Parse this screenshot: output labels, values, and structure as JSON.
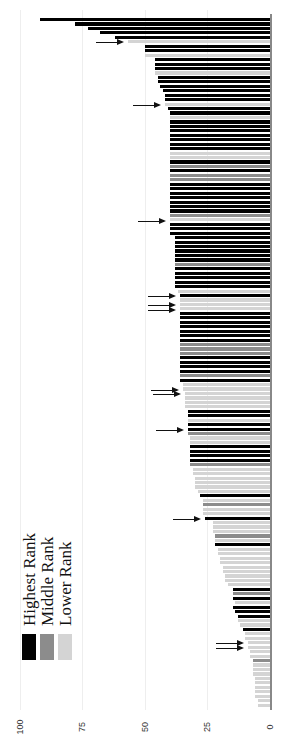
{
  "chart_data": {
    "type": "bar",
    "orientation": "horizontal-rotated",
    "title": "",
    "xlabel": "",
    "ylabel": "",
    "ylim": [
      0,
      100
    ],
    "ticks": [
      "0",
      "25",
      "50",
      "75",
      "100"
    ],
    "grid": true,
    "legend": {
      "position": "lower-left",
      "entries": [
        {
          "label": "Highest Rank",
          "color": "#000000"
        },
        {
          "label": "Middle Rank",
          "color": "#8c8c8c"
        },
        {
          "label": "Lower Rank",
          "color": "#d4d4d4"
        }
      ]
    },
    "bars": [
      {
        "v": 92,
        "c": "H"
      },
      {
        "v": 78,
        "c": "H"
      },
      {
        "v": 73,
        "c": "H"
      },
      {
        "v": 68,
        "c": "H"
      },
      {
        "v": 62,
        "c": "H"
      },
      {
        "v": 57,
        "c": "L"
      },
      {
        "v": 50,
        "c": "H"
      },
      {
        "v": 50,
        "c": "H"
      },
      {
        "v": 50,
        "c": "L"
      },
      {
        "v": 46,
        "c": "H"
      },
      {
        "v": 46,
        "c": "H"
      },
      {
        "v": 46,
        "c": "H"
      },
      {
        "v": 46,
        "c": "L"
      },
      {
        "v": 45,
        "c": "H"
      },
      {
        "v": 45,
        "c": "H"
      },
      {
        "v": 44,
        "c": "H"
      },
      {
        "v": 43,
        "c": "H"
      },
      {
        "v": 42,
        "c": "H"
      },
      {
        "v": 42,
        "c": "H"
      },
      {
        "v": 42,
        "c": "L"
      },
      {
        "v": 41,
        "c": "H"
      },
      {
        "v": 40,
        "c": "H"
      },
      {
        "v": 40,
        "c": "L"
      },
      {
        "v": 40,
        "c": "H"
      },
      {
        "v": 40,
        "c": "H"
      },
      {
        "v": 40,
        "c": "H"
      },
      {
        "v": 40,
        "c": "H"
      },
      {
        "v": 40,
        "c": "H"
      },
      {
        "v": 40,
        "c": "H"
      },
      {
        "v": 40,
        "c": "H"
      },
      {
        "v": 40,
        "c": "L"
      },
      {
        "v": 40,
        "c": "L"
      },
      {
        "v": 40,
        "c": "H"
      },
      {
        "v": 40,
        "c": "M"
      },
      {
        "v": 40,
        "c": "H"
      },
      {
        "v": 40,
        "c": "M"
      },
      {
        "v": 40,
        "c": "M"
      },
      {
        "v": 40,
        "c": "H"
      },
      {
        "v": 40,
        "c": "H"
      },
      {
        "v": 40,
        "c": "H"
      },
      {
        "v": 40,
        "c": "H"
      },
      {
        "v": 40,
        "c": "H"
      },
      {
        "v": 40,
        "c": "H"
      },
      {
        "v": 40,
        "c": "H"
      },
      {
        "v": 40,
        "c": "M"
      },
      {
        "v": 40,
        "c": "L"
      },
      {
        "v": 40,
        "c": "H"
      },
      {
        "v": 40,
        "c": "H"
      },
      {
        "v": 40,
        "c": "H"
      },
      {
        "v": 38,
        "c": "H"
      },
      {
        "v": 38,
        "c": "H"
      },
      {
        "v": 38,
        "c": "H"
      },
      {
        "v": 38,
        "c": "H"
      },
      {
        "v": 38,
        "c": "H"
      },
      {
        "v": 38,
        "c": "H"
      },
      {
        "v": 38,
        "c": "M"
      },
      {
        "v": 38,
        "c": "H"
      },
      {
        "v": 38,
        "c": "H"
      },
      {
        "v": 38,
        "c": "H"
      },
      {
        "v": 38,
        "c": "H"
      },
      {
        "v": 38,
        "c": "H"
      },
      {
        "v": 37,
        "c": "L"
      },
      {
        "v": 36,
        "c": "H"
      },
      {
        "v": 36,
        "c": "L"
      },
      {
        "v": 36,
        "c": "L"
      },
      {
        "v": 36,
        "c": "L"
      },
      {
        "v": 36,
        "c": "H"
      },
      {
        "v": 36,
        "c": "H"
      },
      {
        "v": 36,
        "c": "H"
      },
      {
        "v": 36,
        "c": "H"
      },
      {
        "v": 36,
        "c": "H"
      },
      {
        "v": 36,
        "c": "H"
      },
      {
        "v": 36,
        "c": "H"
      },
      {
        "v": 36,
        "c": "M"
      },
      {
        "v": 36,
        "c": "M"
      },
      {
        "v": 36,
        "c": "M"
      },
      {
        "v": 36,
        "c": "H"
      },
      {
        "v": 36,
        "c": "H"
      },
      {
        "v": 36,
        "c": "H"
      },
      {
        "v": 36,
        "c": "H"
      },
      {
        "v": 36,
        "c": "M"
      },
      {
        "v": 36,
        "c": "H"
      },
      {
        "v": 35,
        "c": "L"
      },
      {
        "v": 35,
        "c": "L"
      },
      {
        "v": 34,
        "c": "L"
      },
      {
        "v": 34,
        "c": "L"
      },
      {
        "v": 34,
        "c": "L"
      },
      {
        "v": 34,
        "c": "L"
      },
      {
        "v": 33,
        "c": "H"
      },
      {
        "v": 33,
        "c": "H"
      },
      {
        "v": 33,
        "c": "L"
      },
      {
        "v": 33,
        "c": "H"
      },
      {
        "v": 33,
        "c": "H"
      },
      {
        "v": 33,
        "c": "M"
      },
      {
        "v": 32,
        "c": "L"
      },
      {
        "v": 32,
        "c": "L"
      },
      {
        "v": 32,
        "c": "H"
      },
      {
        "v": 32,
        "c": "H"
      },
      {
        "v": 32,
        "c": "H"
      },
      {
        "v": 32,
        "c": "H"
      },
      {
        "v": 32,
        "c": "M"
      },
      {
        "v": 31,
        "c": "L"
      },
      {
        "v": 31,
        "c": "L"
      },
      {
        "v": 30,
        "c": "L"
      },
      {
        "v": 30,
        "c": "L"
      },
      {
        "v": 30,
        "c": "L"
      },
      {
        "v": 29,
        "c": "L"
      },
      {
        "v": 28,
        "c": "H"
      },
      {
        "v": 27,
        "c": "L"
      },
      {
        "v": 27,
        "c": "M"
      },
      {
        "v": 27,
        "c": "L"
      },
      {
        "v": 27,
        "c": "L"
      },
      {
        "v": 26,
        "c": "H"
      },
      {
        "v": 23,
        "c": "L"
      },
      {
        "v": 23,
        "c": "L"
      },
      {
        "v": 23,
        "c": "L"
      },
      {
        "v": 22,
        "c": "M"
      },
      {
        "v": 22,
        "c": "L"
      },
      {
        "v": 22,
        "c": "H"
      },
      {
        "v": 21,
        "c": "L"
      },
      {
        "v": 21,
        "c": "L"
      },
      {
        "v": 20,
        "c": "L"
      },
      {
        "v": 20,
        "c": "L"
      },
      {
        "v": 19,
        "c": "L"
      },
      {
        "v": 19,
        "c": "L"
      },
      {
        "v": 18,
        "c": "L"
      },
      {
        "v": 18,
        "c": "L"
      },
      {
        "v": 17,
        "c": "L"
      },
      {
        "v": 15,
        "c": "H"
      },
      {
        "v": 15,
        "c": "M"
      },
      {
        "v": 15,
        "c": "H"
      },
      {
        "v": 14,
        "c": "L"
      },
      {
        "v": 15,
        "c": "H"
      },
      {
        "v": 14,
        "c": "H"
      },
      {
        "v": 13,
        "c": "H"
      },
      {
        "v": 13,
        "c": "L"
      },
      {
        "v": 12,
        "c": "L"
      },
      {
        "v": 11,
        "c": "H"
      },
      {
        "v": 10,
        "c": "L"
      },
      {
        "v": 10,
        "c": "L"
      },
      {
        "v": 9,
        "c": "L"
      },
      {
        "v": 9,
        "c": "L"
      },
      {
        "v": 8,
        "c": "L"
      },
      {
        "v": 8,
        "c": "L"
      },
      {
        "v": 7,
        "c": "M"
      },
      {
        "v": 7,
        "c": "L"
      },
      {
        "v": 7,
        "c": "L"
      },
      {
        "v": 7,
        "c": "L"
      },
      {
        "v": 6,
        "c": "L"
      },
      {
        "v": 6,
        "c": "L"
      },
      {
        "v": 6,
        "c": "L"
      },
      {
        "v": 6,
        "c": "L"
      },
      {
        "v": 6,
        "c": "L"
      },
      {
        "v": 5,
        "c": "L"
      },
      {
        "v": 5,
        "c": "L"
      }
    ],
    "annotations": {
      "arrows_at_bar_index": [
        5,
        19,
        45,
        62,
        64,
        65,
        83,
        84,
        92,
        112,
        140,
        141
      ]
    }
  },
  "legend_labels": [
    "Highest Rank",
    "Middle Rank",
    "Lower Rank"
  ],
  "tick_labels": [
    "100",
    "75",
    "50",
    "25",
    "0"
  ]
}
